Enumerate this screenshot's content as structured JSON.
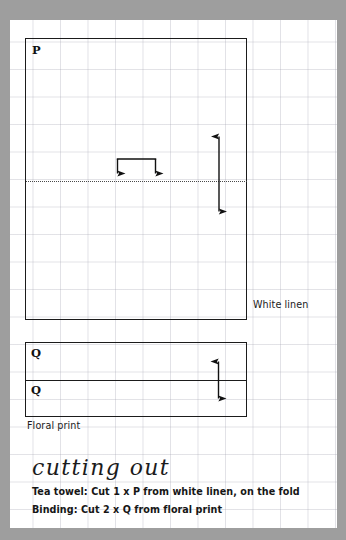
{
  "page": {
    "background_color": "#9e9e9e",
    "paper_color": "#ffffff",
    "grid_color": "#a0a0af"
  },
  "pattern": {
    "pieces": [
      {
        "id": "P",
        "label": "P",
        "fabric_caption": "White linen",
        "has_fold_line": true,
        "measure_arrow": "vertical-double-headed"
      },
      {
        "id": "Q",
        "label_top": "Q",
        "label_bottom": "Q",
        "fabric_caption": "Floral print",
        "measure_arrow": "vertical-double-headed"
      }
    ],
    "fold_bracket": {
      "name": "fold-bracket",
      "arrow_count": 2,
      "direction": "down"
    }
  },
  "instructions": {
    "heading": "cutting out",
    "lines": [
      "Tea towel: Cut 1 x P from white linen, on the fold",
      "Binding: Cut 2 x Q from floral print"
    ]
  }
}
